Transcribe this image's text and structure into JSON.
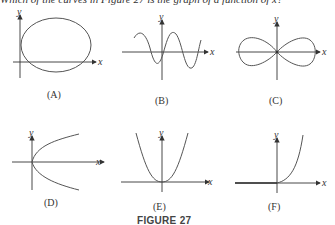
{
  "header_text": "Which of the curves in Figure 27 is the graph of a function of x?",
  "figure_title": "FIGURE 27",
  "axis_labels": {
    "x": "x",
    "y": "y"
  },
  "panels": [
    {
      "id": "A",
      "caption": "(A)",
      "curve": "ellipse"
    },
    {
      "id": "B",
      "caption": "(B)",
      "curve": "sine wave"
    },
    {
      "id": "C",
      "caption": "(C)",
      "curve": "figure-eight (lemniscate)"
    },
    {
      "id": "D",
      "caption": "(D)",
      "curve": "sideways parabola"
    },
    {
      "id": "E",
      "caption": "(E)",
      "curve": "upward parabola"
    },
    {
      "id": "F",
      "caption": "(F)",
      "curve": "zero for x<0, increasing for x>0"
    }
  ],
  "colors": {
    "curve": "#555555",
    "axis": "#333333"
  }
}
